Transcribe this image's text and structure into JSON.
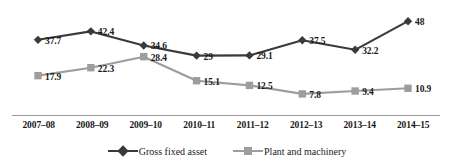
{
  "chart_data": {
    "type": "line",
    "title": "",
    "subtitle": "",
    "xlabel": "",
    "ylabel": "",
    "ylim": [
      0,
      52
    ],
    "grid": false,
    "legend_position": "bottom-center",
    "categories": [
      "2007–08",
      "2008–09",
      "2009–10",
      "2010–11",
      "2011–12",
      "2012–13",
      "2013–14",
      "2014–15"
    ],
    "series": [
      {
        "name": "Gross fixed asset",
        "marker": "diamond",
        "color": "#3a3a3a",
        "values": [
          37.7,
          42.4,
          34.6,
          29,
          29.1,
          37.5,
          32.2,
          48
        ],
        "labels": [
          "37.7",
          "42.4",
          "34.6",
          "29",
          "29.1",
          "37.5",
          "32.2",
          "48"
        ]
      },
      {
        "name": "Plant and machinery",
        "marker": "square",
        "color": "#9d9d9d",
        "values": [
          17.9,
          22.3,
          28.4,
          15.1,
          12.5,
          7.8,
          9.4,
          10.9
        ],
        "labels": [
          "17.9",
          "22.3",
          "28.4",
          "15.1",
          "12.5",
          "7.8",
          "9.4",
          "10.9"
        ]
      }
    ]
  }
}
